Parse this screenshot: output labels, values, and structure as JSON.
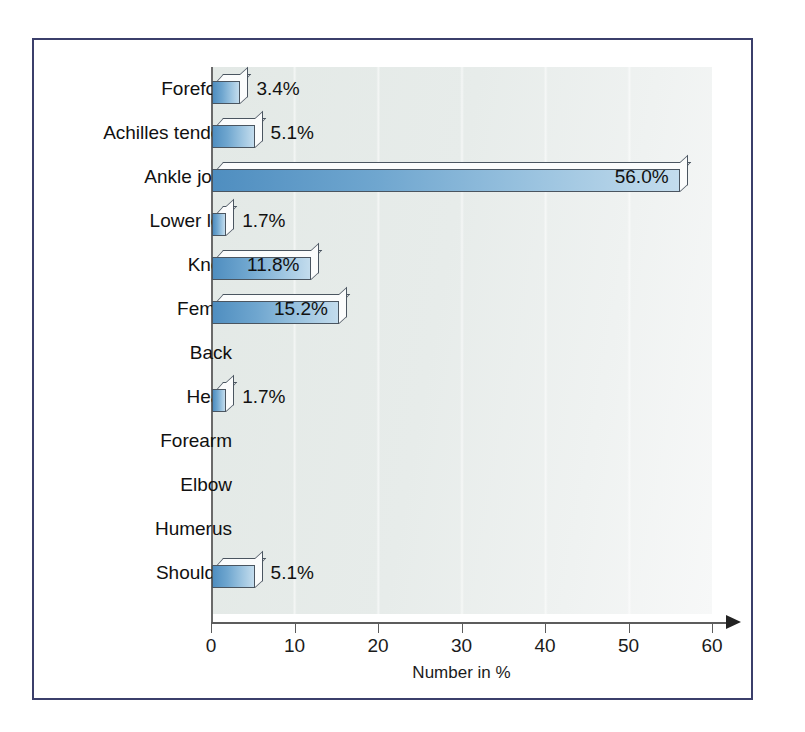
{
  "figure": {
    "frame_color": "#3b3f6b",
    "background_color": "#ffffff",
    "plot_background_color": "#e7ecea",
    "bar_fill_start": "#4f8ec0",
    "bar_fill_end": "#c3dced",
    "bar_outline_color": "#4a5560",
    "axis_color": "#5c5c5c"
  },
  "chart_data": {
    "type": "bar",
    "orientation": "horizontal",
    "title": "",
    "xlabel": "Number in %",
    "ylabel": "",
    "xlim": [
      0,
      60
    ],
    "xticks": [
      0,
      10,
      20,
      30,
      40,
      50,
      60
    ],
    "xtick_labels": [
      "0",
      "10",
      "20",
      "30",
      "40",
      "50",
      "60"
    ],
    "grid": true,
    "grid_axis": "x",
    "legend": false,
    "categories": [
      "Forefoot",
      "Achilles tendon",
      "Ankle joint",
      "Lower leg",
      "Knee",
      "Femur",
      "Back",
      "Head",
      "Forearm",
      "Elbow",
      "Humerus",
      "Shoulder"
    ],
    "values": [
      3.4,
      5.1,
      56.0,
      1.7,
      11.8,
      15.2,
      0,
      1.7,
      0,
      0,
      0,
      5.1
    ],
    "data_labels": [
      "3.4%",
      "5.1%",
      "56.0%",
      "1.7%",
      "11.8%",
      "15.2%",
      "",
      "1.7%",
      "",
      "",
      "",
      "5.1%"
    ],
    "label_placement": [
      "outside",
      "outside",
      "inside",
      "outside",
      "inside",
      "inside",
      "none",
      "outside",
      "none",
      "none",
      "none",
      "outside"
    ]
  }
}
